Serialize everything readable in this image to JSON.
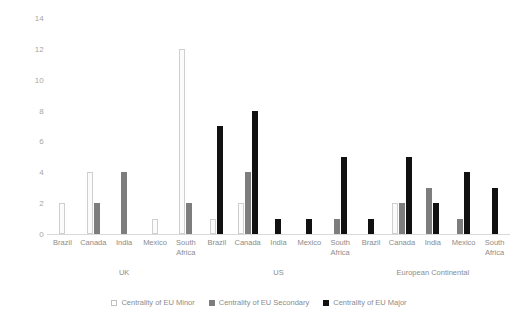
{
  "chart_data": {
    "type": "bar",
    "title": "",
    "subtitle": "",
    "xlabel": "",
    "ylabel": "",
    "ylim": [
      0,
      14
    ],
    "yticks": [
      0,
      2,
      4,
      6,
      8,
      10,
      12,
      14
    ],
    "grid": false,
    "legend_position": "bottom",
    "categories": [
      "Brazil",
      "Canada",
      "India",
      "Mexico",
      "South Africa"
    ],
    "groups": [
      "UK",
      "US",
      "European Continental"
    ],
    "series": [
      {
        "name": "Centrality of EU Minor",
        "color": "#fbfbfb",
        "values": {
          "UK": [
            2,
            4,
            0,
            1,
            12
          ],
          "US": [
            1,
            2,
            0,
            0,
            0
          ],
          "European Continental": [
            0,
            2,
            0,
            0,
            0
          ]
        }
      },
      {
        "name": "Centrality of EU Secondary",
        "color": "#7d7d7d",
        "values": {
          "UK": [
            0,
            2,
            4,
            0,
            2
          ],
          "US": [
            0,
            4,
            0,
            0,
            1
          ],
          "European Continental": [
            0,
            2,
            3,
            1,
            0
          ]
        }
      },
      {
        "name": "Centrality of EU Major",
        "color": "#111111",
        "values": {
          "UK": [
            0,
            0,
            0,
            0,
            0
          ],
          "US": [
            7,
            8,
            1,
            1,
            5
          ],
          "European Continental": [
            1,
            5,
            2,
            4,
            3
          ]
        }
      }
    ]
  },
  "axis": {
    "y_tick_labels": [
      "14",
      "12",
      "10",
      "8",
      "6",
      "4",
      "2",
      "0"
    ]
  },
  "legend": {
    "items": [
      {
        "label": "Centrality of EU Minor",
        "key": "minor"
      },
      {
        "label": "Centrality of EU Secondary",
        "key": "secondary"
      },
      {
        "label": "Centrality of EU Major",
        "key": "major"
      }
    ]
  }
}
